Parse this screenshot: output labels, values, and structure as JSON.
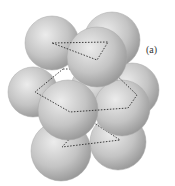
{
  "figure": {
    "label": "(a)",
    "layers": [
      {
        "name": "top-layer",
        "spheres": [
          {
            "cx": 112,
            "cy": 40,
            "r": 28
          },
          {
            "cx": 52,
            "cy": 43,
            "r": 27
          },
          {
            "cx": 97,
            "cy": 57,
            "r": 30
          }
        ],
        "outline": "triangle",
        "outline_points": [
          [
            52,
            43
          ],
          [
            108,
            42
          ],
          [
            97,
            60
          ]
        ]
      },
      {
        "name": "middle-layer",
        "spheres": [
          {
            "cx": 132,
            "cy": 90,
            "r": 27
          },
          {
            "cx": 33,
            "cy": 92,
            "r": 25
          },
          {
            "cx": 95,
            "cy": 88,
            "r": 24
          },
          {
            "cx": 122,
            "cy": 108,
            "r": 28
          },
          {
            "cx": 68,
            "cy": 110,
            "r": 30
          }
        ],
        "outline": "hexagon",
        "outline_points": [
          [
            63,
            69
          ],
          [
            110,
            69
          ],
          [
            137,
            95
          ],
          [
            128,
            108
          ],
          [
            70,
            112
          ],
          [
            35,
            92
          ]
        ]
      },
      {
        "name": "bottom-layer",
        "spheres": [
          {
            "cx": 118,
            "cy": 142,
            "r": 28
          },
          {
            "cx": 61,
            "cy": 151,
            "r": 30
          }
        ],
        "outline": "triangle",
        "outline_points": [
          [
            88,
            119
          ],
          [
            120,
            140
          ],
          [
            62,
            147
          ]
        ]
      }
    ],
    "colors": {
      "sphere_light": "#e6e6e6",
      "sphere_mid": "#bdbdbd",
      "sphere_dark": "#8f8f8f",
      "dash": "#2a2a2a",
      "background": "#ffffff"
    }
  }
}
